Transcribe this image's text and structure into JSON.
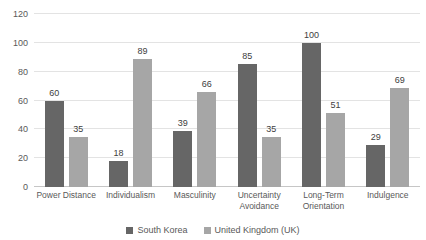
{
  "chart_data": {
    "type": "bar",
    "title": "",
    "categories": [
      "Power Distance",
      "Individualism",
      "Masculinity",
      "Uncertainty Avoidance",
      "Long-Term Orientation",
      "Indulgence"
    ],
    "series": [
      {
        "name": "South Korea",
        "color": "#666666",
        "values": [
          60,
          18,
          39,
          85,
          100,
          29
        ]
      },
      {
        "name": "United Kingdom (UK)",
        "color": "#a6a6a6",
        "values": [
          35,
          89,
          66,
          35,
          51,
          69
        ]
      }
    ],
    "ylim": [
      0,
      120
    ],
    "ytick_step": 20,
    "ytick_labels": [
      "0",
      "20",
      "40",
      "60",
      "80",
      "100",
      "120"
    ],
    "grid": true,
    "legend_position": "bottom",
    "colors": {
      "background": "#ffffff",
      "gridline": "#e3e3e3",
      "axis_line": "#c6c6c6",
      "axis_text": "#595959",
      "data_label": "#404040"
    }
  }
}
